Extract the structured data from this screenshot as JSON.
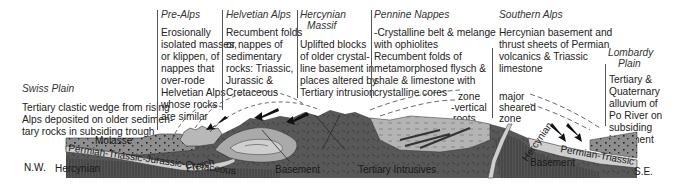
{
  "regions": {
    "swiss_plain": {
      "title": "Swiss Plain",
      "lines": [
        "Tertiary clastic wedge from rising",
        "Alps deposited on older sedimen-",
        "tary rocks in subsiding trough"
      ]
    },
    "pre_alps": {
      "title": "Pre-Alps",
      "lines": [
        "Erosionally",
        "isolated masses,",
        "or klippen, of",
        "nappes that",
        "over-rode",
        "Helvetian Alps",
        "whose rocks",
        "are similar"
      ]
    },
    "helvetian_alps": {
      "title": "Helvetian Alps",
      "lines": [
        "Recumbent folds",
        "or nappes of",
        "sedimentary",
        "rocks:  Triassic,",
        "Jurassic &",
        "Cretaceous"
      ]
    },
    "hercynian_massif": {
      "title_lines": [
        "Hercynian",
        "Massif"
      ],
      "lines": [
        "Uplifted blocks",
        "of older crystal-",
        "line basement in",
        "places altered by",
        "Tertiary intrusion"
      ]
    },
    "pennine_nappes": {
      "title": "Pennine Nappes",
      "lines": [
        "-Crystalline belt & melange",
        "with ophiolites",
        "Recumbent folds of",
        "metamorphosed flysch &",
        "shale & limestone with",
        "crystalline cores"
      ]
    },
    "southern_alps": {
      "title": "Southern Alps",
      "lines": [
        "Hercynian basement and",
        "thrust sheets of Permian",
        "volcanics & Triassic",
        "limestone"
      ]
    },
    "lombardy_plain": {
      "title_lines": [
        "Lombardy",
        "Plain"
      ],
      "lines": [
        "Tertiary &",
        "Quaternary",
        "alluvium of",
        "Po River on",
        "subsiding",
        "basement"
      ]
    }
  },
  "annotations": {
    "zone_vertical_roots": [
      "zone",
      "-vertical",
      "roots"
    ],
    "major_sheared_zone": [
      "major",
      "sheared",
      "zone"
    ]
  },
  "diagram_labels": {
    "molasse": "Molasse",
    "permian_to_cretaceous": "Permian-Triassic-Jurassic-Cretaceous",
    "flysch": "Flysch",
    "nw": "N.W.",
    "hercynian_left": "Hercynian",
    "basement_center": "Basement",
    "tertiary_intrusives": "Tertiary Intrusives",
    "hercynian_right": "Hercynian",
    "basement_right": "Basement",
    "permian_triassic_right": "Permian-Triassic",
    "se": "S.E."
  },
  "colors": {
    "basement": "#5a5a5a",
    "basement_dark": "#3e3e3e",
    "sediment_band": "#c8c8c8",
    "molasse": "#8e8e8e",
    "folds_light": "#b0b0b0",
    "intrusive_light": "#a8a8a8",
    "divider": "#555555"
  }
}
